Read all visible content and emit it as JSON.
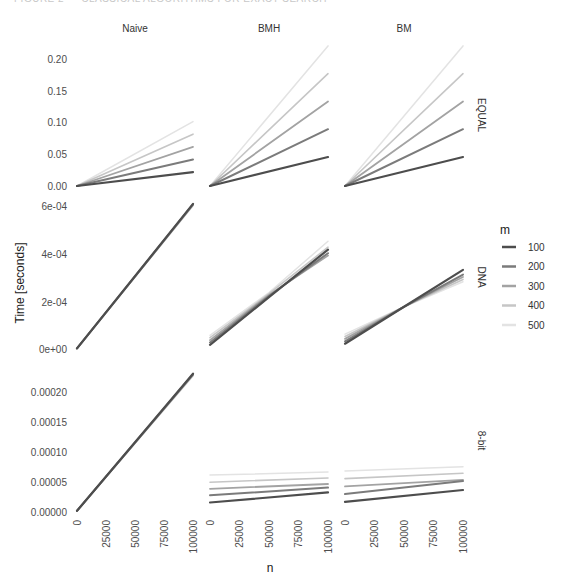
{
  "page": {
    "heading_partial": "FIGURE 2 — CLASSICAL ALGORITHMS FOR EXACT SEARCH"
  },
  "chart_data": {
    "type": "line",
    "layout": "facet_grid",
    "title": "",
    "xlabel": "n",
    "ylabel": "Time [seconds]",
    "grid": false,
    "legend": {
      "title": "m",
      "position": "right",
      "entries": [
        "100",
        "200",
        "300",
        "400",
        "500"
      ],
      "colors": [
        "#4d4d4d",
        "#7b7b7b",
        "#a3a3a3",
        "#c6c6c6",
        "#e3e3e3"
      ]
    },
    "columns": [
      "Naive",
      "BMH",
      "BM"
    ],
    "rows": [
      {
        "label": "EQUAL",
        "ylim": [
          0,
          0.225
        ],
        "yticks": [
          0.0,
          0.05,
          0.1,
          0.15,
          0.2
        ],
        "ytick_labels": [
          "0.00",
          "0.05",
          "0.10",
          "0.15",
          "0.20"
        ],
        "panels": {
          "Naive": {
            "x": [
              0,
              100000
            ],
            "series": [
              {
                "name": "100",
                "values": [
                  0,
                  0.022
                ]
              },
              {
                "name": "200",
                "values": [
                  0,
                  0.042
                ]
              },
              {
                "name": "300",
                "values": [
                  0,
                  0.062
                ]
              },
              {
                "name": "400",
                "values": [
                  0,
                  0.082
                ]
              },
              {
                "name": "500",
                "values": [
                  0,
                  0.102
                ]
              }
            ]
          },
          "BMH": {
            "x": [
              0,
              100000
            ],
            "series": [
              {
                "name": "100",
                "values": [
                  0,
                  0.046
                ]
              },
              {
                "name": "200",
                "values": [
                  0,
                  0.09
                ]
              },
              {
                "name": "300",
                "values": [
                  0,
                  0.134
                ]
              },
              {
                "name": "400",
                "values": [
                  0,
                  0.178
                ]
              },
              {
                "name": "500",
                "values": [
                  0,
                  0.222
                ]
              }
            ]
          },
          "BM": {
            "x": [
              0,
              100000
            ],
            "series": [
              {
                "name": "100",
                "values": [
                  0,
                  0.046
                ]
              },
              {
                "name": "200",
                "values": [
                  0,
                  0.09
                ]
              },
              {
                "name": "300",
                "values": [
                  0,
                  0.134
                ]
              },
              {
                "name": "400",
                "values": [
                  0,
                  0.178
                ]
              },
              {
                "name": "500",
                "values": [
                  0,
                  0.222
                ]
              }
            ]
          }
        }
      },
      {
        "label": "DNA",
        "ylim": [
          -1e-05,
          0.00062
        ],
        "yticks": [
          0,
          0.0002,
          0.0004,
          0.0006
        ],
        "ytick_labels": [
          "0e+00",
          "2e-04",
          "4e-04",
          "6e-04"
        ],
        "panels": {
          "Naive": {
            "x": [
              0,
              100000
            ],
            "series": [
              {
                "name": "100",
                "values": [
                  5e-06,
                  0.000612
                ]
              },
              {
                "name": "200",
                "values": [
                  5e-06,
                  0.00061
                ]
              },
              {
                "name": "300",
                "values": [
                  5e-06,
                  0.000608
                ]
              },
              {
                "name": "400",
                "values": [
                  5e-06,
                  0.000606
                ]
              },
              {
                "name": "500",
                "values": [
                  5e-06,
                  0.000604
                ]
              }
            ]
          },
          "BMH": {
            "x": [
              0,
              50000,
              100000
            ],
            "series": [
              {
                "name": "100",
                "values": [
                  2e-05,
                  0.00022,
                  0.00042
                ]
              },
              {
                "name": "200",
                "values": [
                  3e-05,
                  0.000225,
                  0.000405
                ]
              },
              {
                "name": "300",
                "values": [
                  4e-05,
                  0.00023,
                  0.000395
                ]
              },
              {
                "name": "400",
                "values": [
                  5e-05,
                  0.000235,
                  0.00043
                ]
              },
              {
                "name": "500",
                "values": [
                  6e-05,
                  0.00024,
                  0.000455
                ]
              }
            ]
          },
          "BM": {
            "x": [
              0,
              50000,
              100000
            ],
            "series": [
              {
                "name": "100",
                "values": [
                  2.5e-05,
                  0.00018,
                  0.000335
                ]
              },
              {
                "name": "200",
                "values": [
                  3.5e-05,
                  0.00018,
                  0.000315
                ]
              },
              {
                "name": "300",
                "values": [
                  4.5e-05,
                  0.00018,
                  0.000305
                ]
              },
              {
                "name": "400",
                "values": [
                  5.5e-05,
                  0.00018,
                  0.000295
                ]
              },
              {
                "name": "500",
                "values": [
                  6.5e-05,
                  0.00018,
                  0.000285
                ]
              }
            ]
          }
        }
      },
      {
        "label": "8-bit",
        "ylim": [
          -5e-06,
          0.000245
        ],
        "yticks": [
          0,
          5e-05,
          0.0001,
          0.00015,
          0.0002
        ],
        "ytick_labels": [
          "0.00000",
          "0.00005",
          "0.00010",
          "0.00015",
          "0.00020"
        ],
        "panels": {
          "Naive": {
            "x": [
              0,
              100000
            ],
            "series": [
              {
                "name": "100",
                "values": [
                  2e-06,
                  0.000232
                ]
              },
              {
                "name": "200",
                "values": [
                  2e-06,
                  0.000231
                ]
              },
              {
                "name": "300",
                "values": [
                  2e-06,
                  0.00023
                ]
              },
              {
                "name": "400",
                "values": [
                  2e-06,
                  0.000229
                ]
              },
              {
                "name": "500",
                "values": [
                  2e-06,
                  0.000228
                ]
              }
            ]
          },
          "BMH": {
            "x": [
              0,
              100000
            ],
            "series": [
              {
                "name": "100",
                "values": [
                  1.6e-05,
                  3.3e-05
                ]
              },
              {
                "name": "200",
                "values": [
                  2.8e-05,
                  4.1e-05
                ]
              },
              {
                "name": "300",
                "values": [
                  3.9e-05,
                  4.7e-05
                ]
              },
              {
                "name": "400",
                "values": [
                  5e-05,
                  5.7e-05
                ]
              },
              {
                "name": "500",
                "values": [
                  6.2e-05,
                  6.7e-05
                ]
              }
            ]
          },
          "BM": {
            "x": [
              0,
              100000
            ],
            "series": [
              {
                "name": "100",
                "values": [
                  1.7e-05,
                  3.7e-05
                ]
              },
              {
                "name": "200",
                "values": [
                  3e-05,
                  5.2e-05
                ]
              },
              {
                "name": "300",
                "values": [
                  4.3e-05,
                  5.4e-05
                ]
              },
              {
                "name": "400",
                "values": [
                  5.6e-05,
                  6.5e-05
                ]
              },
              {
                "name": "500",
                "values": [
                  6.9e-05,
                  7.6e-05
                ]
              }
            ]
          }
        }
      }
    ],
    "xlim": [
      0,
      100000
    ],
    "xticks": [
      0,
      25000,
      50000,
      75000,
      100000
    ],
    "xtick_labels": [
      "0",
      "25000",
      "50000",
      "75000",
      "100000"
    ]
  }
}
